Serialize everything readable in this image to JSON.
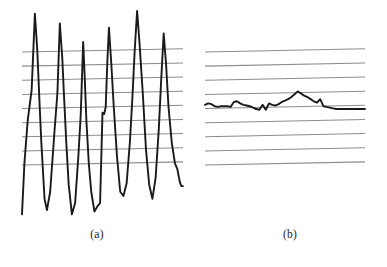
{
  "figure": {
    "background_color": "#ffffff",
    "gridline_color": "#8c8c8c",
    "signal_color": "#1a1a1a",
    "panels": [
      {
        "id": "a",
        "caption": "(a)",
        "description": "high-amplitude oscillatory signal"
      },
      {
        "id": "b",
        "caption": "(b)",
        "description": "low-amplitude near-flat signal"
      }
    ]
  },
  "chart_data": [
    {
      "type": "line",
      "id": "panel-a",
      "title": "(a)",
      "xlabel": "",
      "ylabel": "",
      "grid": true,
      "grid_orientation": "horizontal",
      "gridline_count": 9,
      "gridline_y_values": [
        7,
        6,
        5,
        4,
        3,
        2,
        1,
        0,
        -1
      ],
      "xlim": [
        0,
        100
      ],
      "ylim": [
        -5,
        10
      ],
      "legend": "none",
      "series": [
        {
          "name": "signal-a",
          "color": "#1a1a1a",
          "x": [
            0,
            1.5,
            3.5,
            6.0,
            8.0,
            9.5,
            11.0,
            12.0,
            13.0,
            14.0,
            15.5,
            17.5,
            20.0,
            22.0,
            23.5,
            25.0,
            26.0,
            27.5,
            29.0,
            31.0,
            33.0,
            35.0,
            36.5,
            38.0,
            39.0,
            40.0,
            41.5,
            43.0,
            45.0,
            47.0,
            48.5,
            50.0,
            51.0,
            52.0,
            53.0,
            54.0,
            55.5,
            57.0,
            59.0,
            61.0,
            63.0,
            65.0,
            67.0,
            68.5,
            70.0,
            71.5,
            73.0,
            75.0,
            77.0,
            79.0,
            81.0,
            83.0,
            85.0,
            86.5,
            88.0,
            89.5,
            91.0,
            93.0,
            95.0,
            96.5,
            98.0,
            99.0,
            100.0
          ],
          "y": [
            -4.6,
            -1.0,
            2.0,
            4.2,
            9.6,
            7.0,
            3.0,
            0.5,
            -1.5,
            -3.5,
            -4.3,
            -3.0,
            1.0,
            4.0,
            8.9,
            6.5,
            4.0,
            0.5,
            -2.5,
            -4.6,
            -3.8,
            -0.5,
            2.5,
            7.6,
            5.0,
            2.0,
            -1.0,
            -3.0,
            -4.4,
            -4.0,
            -3.8,
            2.6,
            2.5,
            3.0,
            6.2,
            8.6,
            6.0,
            3.0,
            -0.5,
            -3.0,
            -3.3,
            -2.4,
            0.5,
            3.5,
            7.0,
            9.8,
            7.5,
            4.0,
            0.0,
            -2.5,
            -3.5,
            -2.0,
            1.5,
            5.0,
            8.2,
            6.0,
            3.0,
            0.5,
            -1.0,
            -1.4,
            -2.3,
            -2.6,
            -2.6
          ]
        }
      ]
    },
    {
      "type": "line",
      "id": "panel-b",
      "title": "(b)",
      "xlabel": "",
      "ylabel": "",
      "grid": true,
      "grid_orientation": "horizontal",
      "gridline_count": 9,
      "gridline_y_values": [
        7,
        6,
        5,
        4,
        3,
        2,
        1,
        0,
        -1
      ],
      "xlim": [
        0,
        100
      ],
      "ylim": [
        -5,
        10
      ],
      "legend": "none",
      "series": [
        {
          "name": "signal-b",
          "color": "#1a1a1a",
          "x": [
            0,
            2,
            4,
            6,
            8,
            10,
            12,
            14,
            16,
            18,
            20,
            22,
            24,
            26,
            28,
            30,
            32,
            34,
            36,
            38,
            40,
            42,
            44,
            46,
            48,
            50,
            52,
            54,
            56,
            58,
            60,
            62,
            64,
            66,
            68,
            70,
            72,
            74,
            76,
            78,
            80,
            82,
            84,
            86,
            88,
            90,
            92,
            94,
            96,
            98,
            100
          ],
          "y": [
            3.15,
            3.25,
            3.2,
            3.05,
            3.0,
            3.05,
            3.05,
            3.05,
            3.0,
            3.35,
            3.4,
            3.25,
            3.15,
            3.1,
            3.05,
            2.95,
            2.85,
            2.8,
            3.15,
            2.8,
            3.25,
            3.15,
            3.1,
            3.2,
            3.35,
            3.45,
            3.55,
            3.7,
            3.9,
            4.1,
            3.95,
            3.8,
            3.7,
            3.55,
            3.4,
            3.3,
            3.55,
            3.05,
            3.0,
            2.95,
            2.9,
            2.85,
            2.85,
            2.85,
            2.85,
            2.85,
            2.85,
            2.85,
            2.85,
            2.85,
            2.85
          ]
        }
      ]
    }
  ]
}
